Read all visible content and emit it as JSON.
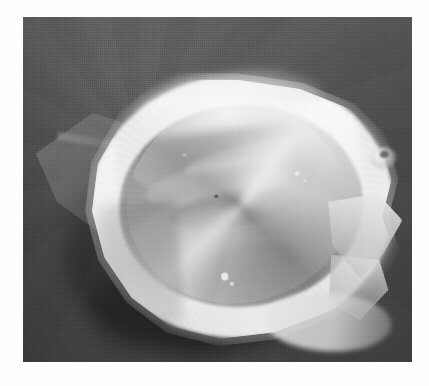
{
  "page": {
    "kind": "photograph",
    "background_color": "#ffffff",
    "width": 429,
    "height": 386
  },
  "photo": {
    "label": "Grayscale close-up photograph of a pale fibrous ring-shaped specimen resting on a dark cloth drape",
    "frame": {
      "left": 23,
      "top": 17,
      "width": 389,
      "height": 345,
      "border_color": "#2e2e2e"
    },
    "color_mode": "grayscale",
    "palette": {
      "paper_white": "#ffffff",
      "drape_dark_gray": "#4d4d4d",
      "drape_light_gray": "#585858",
      "shadow_black": "#2a2a2a",
      "ring_white": "#e9e9e9",
      "ring_highlight": "#fbfbfb",
      "ring_shade_gray": "#b4b4b4",
      "cavity_dark": "#3e3e3e",
      "tissue_mid_gray": "#b2b2b2",
      "specular_white": "#f2f2f2"
    },
    "regions": [
      {
        "name": "background-drape",
        "description": "Dark gray woven cloth filling the whole frame, slightly brighter toward the upper left"
      },
      {
        "name": "cast-shadow",
        "description": "Soft dark shadow falling below and to the left of the specimen"
      },
      {
        "name": "translucent-flap",
        "description": "Thin semi-transparent triangular flap of tissue extending to the left of the ring"
      },
      {
        "name": "fibrous-ring",
        "description": "Thick pale off-white ring, roughly oval and tilted, brightest along the top-left crest, dimmer along the lower-left arc"
      },
      {
        "name": "right-angular-tab",
        "description": "Angular whitish protrusion on the right side of the ring"
      },
      {
        "name": "interior-cavity",
        "description": "Dark recessed interior framed by the ring, containing folded gray membranes and ridges"
      },
      {
        "name": "specular-highlights",
        "description": "Small bright pinpoint reflections in the lower-center and upper-right of the cavity"
      }
    ]
  }
}
